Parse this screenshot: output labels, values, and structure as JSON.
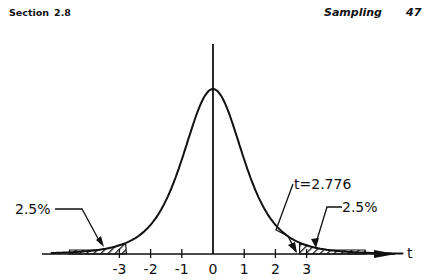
{
  "header": {
    "section_label": "Section",
    "section_number": "2.8",
    "chapter_title": "Sampling",
    "page_number": "47"
  },
  "chart_data": {
    "type": "line",
    "title": "",
    "xlabel": "t",
    "ylabel": "",
    "x_ticks": [
      "-3",
      "-2",
      "-1",
      "0",
      "1",
      "2",
      "3"
    ],
    "xlim": [
      -3.6,
      6.7
    ],
    "grid": false,
    "legend": "none",
    "series": [
      {
        "name": "t density (df=4)",
        "x": [
          -3.0,
          -2.5,
          -2.0,
          -1.5,
          -1.0,
          -0.5,
          0,
          0.5,
          1.0,
          1.5,
          2.0,
          2.5,
          3.0,
          3.5,
          4.0
        ],
        "y": [
          0.0197,
          0.0354,
          0.0663,
          0.122,
          0.2147,
          0.3276,
          0.375,
          0.3276,
          0.2147,
          0.122,
          0.0663,
          0.0354,
          0.0197,
          0.0114,
          0.0067
        ]
      }
    ],
    "annotations": [
      {
        "text": "2.5%",
        "target": "left tail area (t < -2.776)"
      },
      {
        "text": "2.5%",
        "target": "right tail area (t > 2.776)"
      },
      {
        "text": "t=2.776",
        "target": "critical value on right tail"
      }
    ]
  },
  "labels": {
    "left_tail": "2.5%",
    "right_tail": "2.5%",
    "critical": "t=2.776",
    "axis": "t",
    "ticks": [
      "-3",
      "-2",
      "-1",
      "0",
      "1",
      "2",
      "3"
    ]
  }
}
